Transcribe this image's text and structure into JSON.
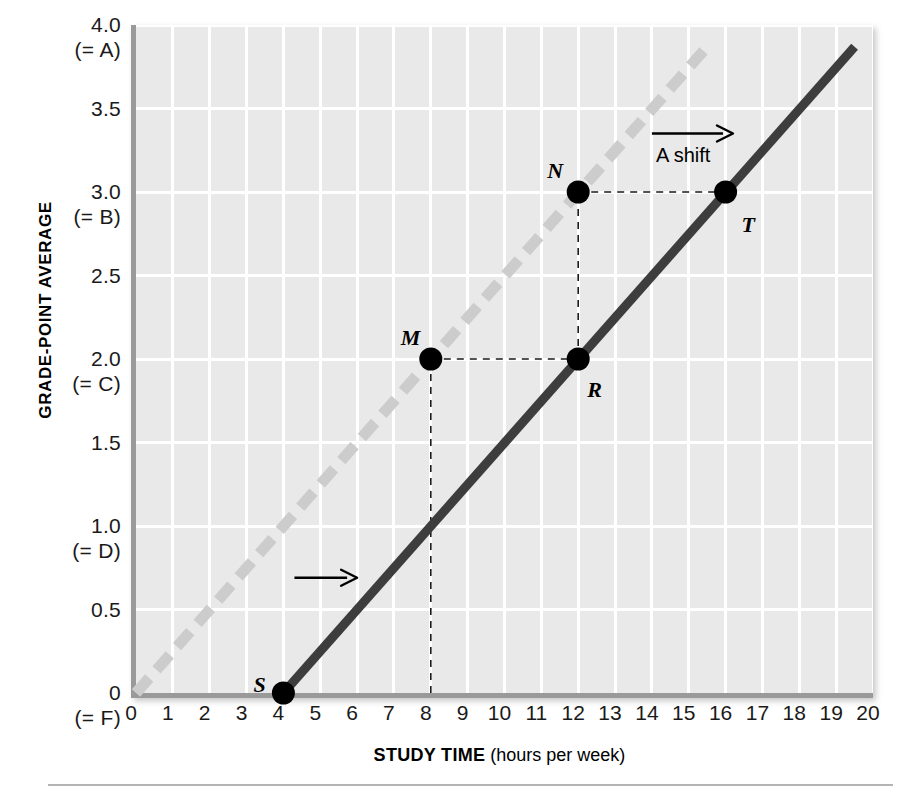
{
  "chart_data": {
    "type": "line",
    "title": "",
    "xlabel": "STUDY TIME (hours per week)",
    "xlabel_bold": "STUDY TIME",
    "xlabel_paren": "(hours per week)",
    "ylabel": "GRADE-POINT AVERAGE",
    "xlim": [
      0,
      20
    ],
    "ylim": [
      0,
      4.0
    ],
    "grid": true,
    "legend": "none",
    "xticks": [
      "0",
      "1",
      "2",
      "3",
      "4",
      "5",
      "6",
      "7",
      "8",
      "9",
      "10",
      "11",
      "12",
      "13",
      "14",
      "15",
      "16",
      "17",
      "18",
      "19",
      "20"
    ],
    "yticks": [
      {
        "value": "4.0",
        "grade": "(= A)"
      },
      {
        "value": "3.5",
        "grade": ""
      },
      {
        "value": "3.0",
        "grade": "(= B)"
      },
      {
        "value": "2.5",
        "grade": ""
      },
      {
        "value": "2.0",
        "grade": "(= C)"
      },
      {
        "value": "1.5",
        "grade": ""
      },
      {
        "value": "1.0",
        "grade": "(= D)"
      },
      {
        "value": "0.5",
        "grade": ""
      },
      {
        "value": "0",
        "grade": "(= F)"
      }
    ],
    "series": [
      {
        "name": "original-line",
        "style": "dashed",
        "color": "#cccccc",
        "x": [
          0,
          15.5
        ],
        "y": [
          0.0,
          3.87
        ]
      },
      {
        "name": "shifted-line",
        "style": "solid",
        "color": "#3d3d3d",
        "x": [
          4,
          19.5
        ],
        "y": [
          0.0,
          3.87
        ]
      }
    ],
    "points": [
      {
        "label": "S",
        "x": 4,
        "y": 0.0,
        "on": "shifted-line"
      },
      {
        "label": "M",
        "x": 8,
        "y": 2.0,
        "on": "original-line"
      },
      {
        "label": "N",
        "x": 12,
        "y": 3.0,
        "on": "original-line"
      },
      {
        "label": "R",
        "x": 12,
        "y": 2.0,
        "on": "shifted-line"
      },
      {
        "label": "T",
        "x": 16,
        "y": 3.0,
        "on": "shifted-line"
      }
    ],
    "annotations": [
      {
        "label": "A shift",
        "type": "arrow-right",
        "x_from": 14.0,
        "x_to": 16.2,
        "y": 3.35
      },
      {
        "label": "",
        "type": "arrow-right",
        "x_from": 4.3,
        "x_to": 6.0,
        "y": 0.69
      }
    ],
    "guides": [
      {
        "type": "vline-dashed",
        "x": 8,
        "y_from": 0.0,
        "y_to": 2.0
      },
      {
        "type": "hline-dashed",
        "y": 2.0,
        "x_from": 8,
        "x_to": 12
      },
      {
        "type": "vline-dashed",
        "x": 12,
        "y_from": 2.0,
        "y_to": 3.0
      },
      {
        "type": "hline-dashed",
        "y": 3.0,
        "x_from": 12,
        "x_to": 16
      }
    ]
  },
  "colors": {
    "plot_background": "#e9e9e9",
    "gridline": "#ffffff",
    "axis_frame": "#9a9a9a",
    "original_line": "#cccccc",
    "shifted_line": "#3d3d3d",
    "marker": "#000000",
    "text": "#111111"
  }
}
